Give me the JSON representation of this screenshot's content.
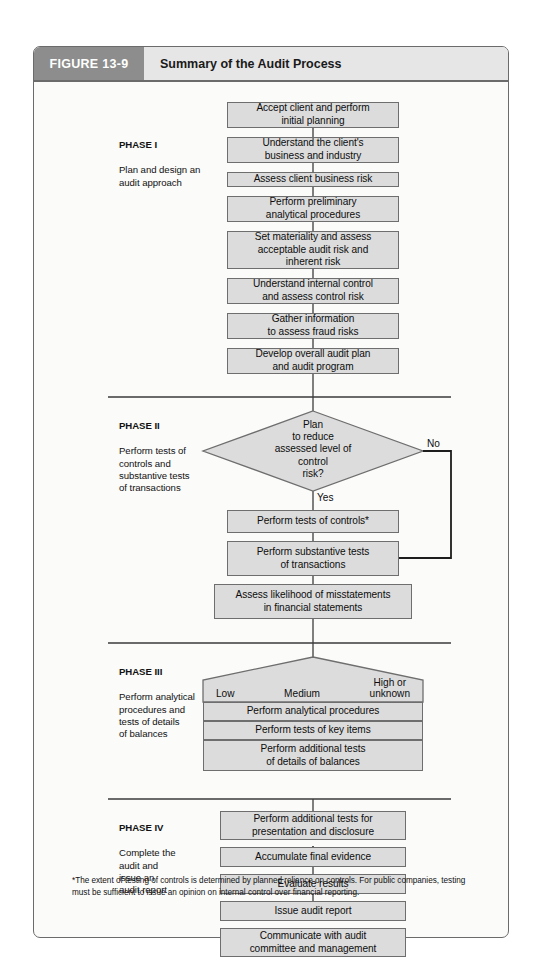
{
  "figure": {
    "number_label": "FIGURE 13-9",
    "title": "Summary of the Audit Process",
    "footnote": "*The extent of testing of controls is determined by planned reliance on controls. For public companies, testing must be sufficient to issue an opinion on internal control over financial reporting."
  },
  "colors": {
    "header_number_bg": "#8d8d8d",
    "header_title_bg": "#e6e6e6",
    "box_fill": "#dcdcdc",
    "box_stroke": "#6e6e6e",
    "frame_stroke": "#6b6b6b",
    "page_bg": "#fbfbfa"
  },
  "phases": [
    {
      "id": "phase-1",
      "heading": "PHASE I",
      "body": "Plan and design an\naudit approach"
    },
    {
      "id": "phase-2",
      "heading": "PHASE II",
      "body": "Perform tests of\ncontrols and\nsubstantive tests\nof transactions"
    },
    {
      "id": "phase-3",
      "heading": "PHASE III",
      "body": "Perform analytical\nprocedures and\ntests of details\nof balances"
    },
    {
      "id": "phase-4",
      "heading": "PHASE IV",
      "body": "Complete the\naudit and\nissue an\naudit report"
    }
  ],
  "steps": {
    "p1_accept_client": "Accept client and perform\ninitial planning",
    "p1_understand_business": "Understand the client's\nbusiness and industry",
    "p1_assess_business_risk": "Assess client business risk",
    "p1_preliminary_analytical": "Perform preliminary\nanalytical procedures",
    "p1_set_materiality": "Set materiality and assess\nacceptable audit risk and\ninherent risk",
    "p1_internal_control": "Understand internal control\nand assess control risk",
    "p1_fraud_risk": "Gather information\nto assess fraud risks",
    "p1_develop_plan": "Develop overall audit plan\nand audit program",
    "p2_decision": "Plan\nto reduce\nassessed level of\ncontrol\nrisk?",
    "p2_yes": "Yes",
    "p2_no": "No",
    "p2_tests_of_controls": "Perform tests of controls*",
    "p2_substantive_tests": "Perform substantive tests\nof transactions",
    "p2_assess_likelihood": "Assess likelihood of misstatements\nin financial statements",
    "p3_risk_low": "Low",
    "p3_risk_medium": "Medium",
    "p3_risk_high": "High or\nunknown",
    "p3_analytical_procedures": "Perform analytical procedures",
    "p3_tests_key_items": "Perform tests of key items",
    "p3_additional_tests": "Perform additional tests\nof details of balances",
    "p4_presentation_disclosure": "Perform additional tests for\npresentation and disclosure",
    "p4_accumulate_evidence": "Accumulate final evidence",
    "p4_evaluate_results": "Evaluate results",
    "p4_issue_report": "Issue audit report",
    "p4_communicate": "Communicate with audit\ncommittee and management"
  }
}
